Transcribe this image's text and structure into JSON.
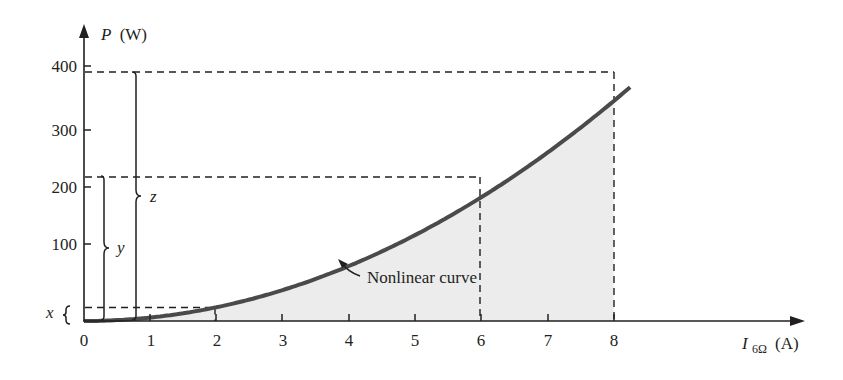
{
  "chart_data": {
    "type": "area",
    "title": "",
    "xlabel": "I_6Ω (A)",
    "xlabel_main": "I",
    "xlabel_sub": "6Ω",
    "xlabel_unit": "(A)",
    "ylabel": "P (W)",
    "ylabel_main": "P",
    "ylabel_unit": "(W)",
    "xlim": [
      0,
      8.2
    ],
    "ylim": [
      0,
      400
    ],
    "x_ticks": [
      0,
      1,
      2,
      3,
      4,
      5,
      6,
      7,
      8
    ],
    "y_ticks": [
      100,
      200,
      300,
      400
    ],
    "grid": false,
    "series": [
      {
        "name": "Nonlinear curve",
        "function": "P = 6·I²",
        "x": [
          0,
          1,
          2,
          3,
          4,
          5,
          6,
          7,
          8,
          8.2
        ],
        "y": [
          0,
          6,
          24,
          54,
          96,
          150,
          216,
          294,
          384,
          403
        ],
        "shaded_under": [
          0,
          8
        ]
      }
    ],
    "reference_points": [
      {
        "x": 2,
        "y": 24,
        "label": "x"
      },
      {
        "x": 6,
        "y": 216,
        "label": "y"
      },
      {
        "x": 8,
        "y": 384,
        "label": "z"
      }
    ],
    "annotations": [
      {
        "text": "Nonlinear curve",
        "points_to_x": 3.8
      },
      {
        "text": "x",
        "type": "brace",
        "from": 0,
        "to": 24
      },
      {
        "text": "y",
        "type": "brace",
        "from": 0,
        "to": 216
      },
      {
        "text": "z",
        "type": "brace",
        "from": 0,
        "to": 384
      }
    ]
  },
  "labels": {
    "y_axis_main": "P",
    "y_axis_unit": "(W)",
    "x_axis_main": "I",
    "x_axis_sub": "6Ω",
    "x_axis_unit": "(A)",
    "curve_label": "Nonlinear curve",
    "brace_x": "x",
    "brace_y": "y",
    "brace_z": "z",
    "xticks": [
      "0",
      "1",
      "2",
      "3",
      "4",
      "5",
      "6",
      "7",
      "8"
    ],
    "yticks": [
      "100",
      "200",
      "300",
      "400"
    ]
  },
  "colors": {
    "axis": "#231f20",
    "curve": "#4a4a4a",
    "fill": "#ececec",
    "dash": "#231f20"
  }
}
